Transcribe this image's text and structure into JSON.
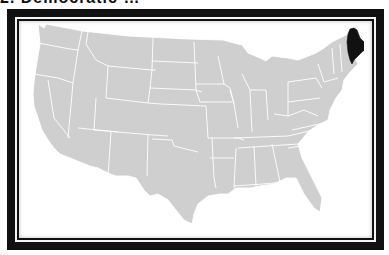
{
  "title": "2. Democratic …",
  "map": {
    "subject": "United States of America (contiguous states)",
    "highlighted_state": "Maine",
    "colors": {
      "state_fill": "#cfcfcf",
      "state_border": "#ffffff",
      "highlight_fill": "#111111",
      "frame": "#111111",
      "background": "#ffffff"
    }
  }
}
